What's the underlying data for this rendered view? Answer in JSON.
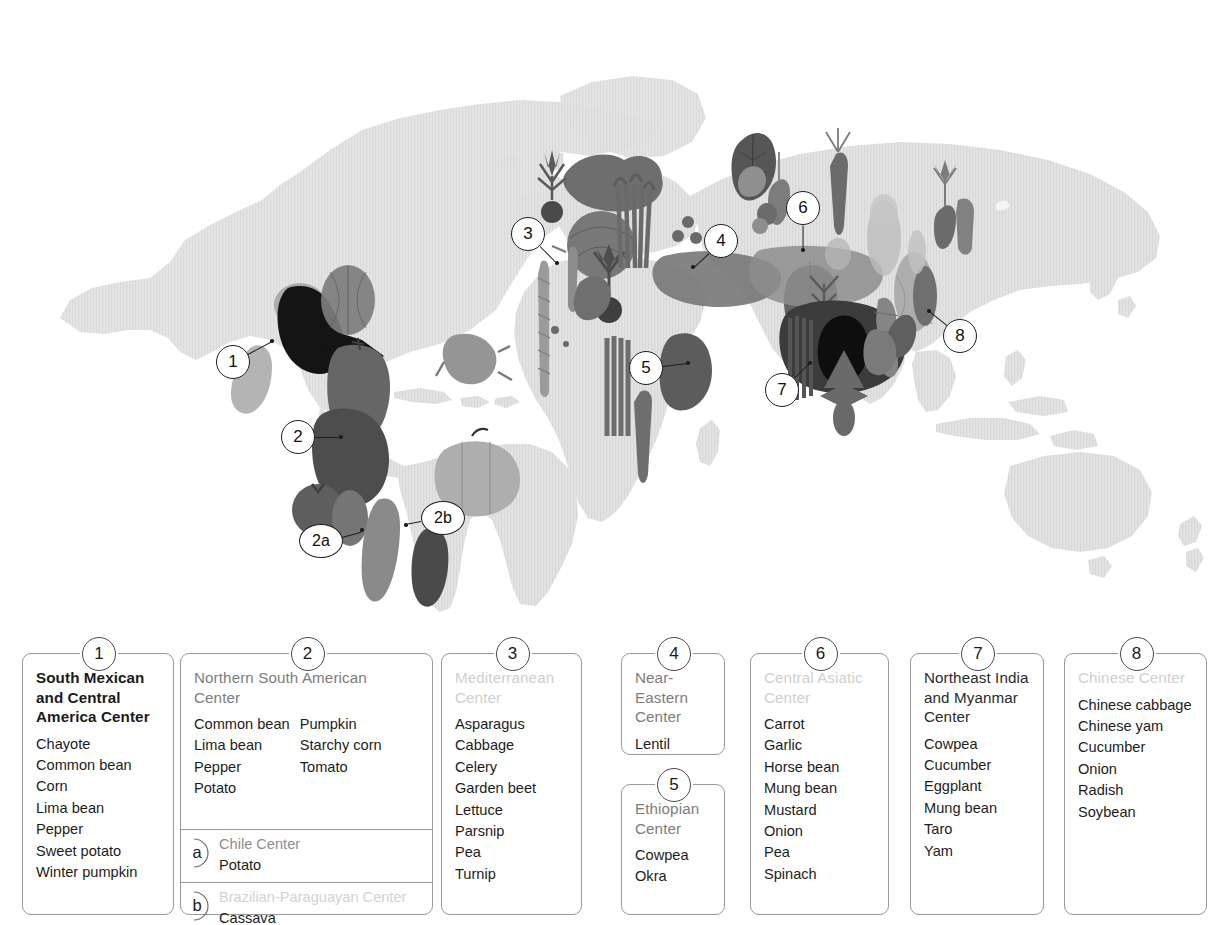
{
  "map": {
    "title": "Centers of Origin of Cultivated Vegetables",
    "landmass_color": "#e2e2e2",
    "ocean_color": "#ffffff",
    "markers": [
      {
        "id": "1",
        "label": "1",
        "x": 233,
        "y": 362,
        "tip_x": 272,
        "tip_y": 341
      },
      {
        "id": "2",
        "label": "2",
        "x": 298,
        "y": 437,
        "tip_x": 341,
        "tip_y": 437
      },
      {
        "id": "2a",
        "label": "2a",
        "x": 321,
        "y": 541,
        "tip_x": 362,
        "tip_y": 530
      },
      {
        "id": "2b",
        "label": "2b",
        "x": 443,
        "y": 518,
        "tip_x": 406,
        "tip_y": 525
      },
      {
        "id": "3",
        "label": "3",
        "x": 528,
        "y": 234,
        "tip_x": 557,
        "tip_y": 263
      },
      {
        "id": "4",
        "label": "4",
        "x": 721,
        "y": 241,
        "tip_x": 693,
        "tip_y": 267
      },
      {
        "id": "5",
        "label": "5",
        "x": 646,
        "y": 368,
        "tip_x": 688,
        "tip_y": 363
      },
      {
        "id": "6",
        "label": "6",
        "x": 803,
        "y": 208,
        "tip_x": 803,
        "tip_y": 250
      },
      {
        "id": "7",
        "label": "7",
        "x": 782,
        "y": 390,
        "tip_x": 810,
        "tip_y": 363
      },
      {
        "id": "8",
        "label": "8",
        "x": 960,
        "y": 336,
        "tip_x": 929,
        "tip_y": 311
      }
    ],
    "vegetable_icons": [
      "chayote",
      "squash",
      "maize",
      "pepper",
      "bean-pod",
      "tomato",
      "potato",
      "cassava",
      "lettuce",
      "cabbage",
      "asparagus",
      "beet",
      "parsnip",
      "celery",
      "turnip",
      "carrot",
      "okra",
      "cowpea",
      "garlic",
      "onion",
      "spinach",
      "radish",
      "cucumber",
      "eggplant",
      "chinese-cabbage",
      "yam",
      "soybean",
      "taro",
      "mung-bean",
      "horse-bean"
    ]
  },
  "legend": {
    "panels": [
      {
        "number": "1",
        "title": "South Mexican\nand Central\nAmerica Center",
        "title_style": "bold",
        "columns": [
          [
            "Chayote",
            "Common bean",
            "Corn",
            "Lima bean",
            "Pepper",
            "Sweet potato",
            "Winter pumpkin"
          ]
        ]
      },
      {
        "number": "2",
        "title": "Northern South American\nCenter",
        "title_style": "mid",
        "columns": [
          [
            "Common bean",
            "Lima bean",
            "Pepper",
            "Potato"
          ],
          [
            "Pumpkin",
            "Starchy corn",
            "Tomato"
          ]
        ],
        "subpanels": [
          {
            "letter": "a",
            "title": "Chile Center",
            "title_style": "mid",
            "items": [
              "Potato"
            ]
          },
          {
            "letter": "b",
            "title": "Brazilian-Paraguayan Center",
            "title_style": "pale",
            "items": [
              "Cassava"
            ]
          }
        ]
      },
      {
        "number": "3",
        "title": "Mediterranean\nCenter",
        "title_style": "pale",
        "columns": [
          [
            "Asparagus",
            "Cabbage",
            "Celery",
            "Garden beet",
            "Lettuce",
            "Parsnip",
            "Pea",
            "Turnip"
          ]
        ]
      },
      {
        "number": "4",
        "title": "Near-Eastern\nCenter",
        "title_style": "mid",
        "columns": [
          [
            "Lentil"
          ]
        ]
      },
      {
        "number": "5",
        "title": "Ethiopian\nCenter",
        "title_style": "mid",
        "columns": [
          [
            "Cowpea",
            "Okra"
          ]
        ]
      },
      {
        "number": "6",
        "title": "Central Asiatic\nCenter",
        "title_style": "pale",
        "columns": [
          [
            "Carrot",
            "Garlic",
            "Horse bean",
            "Mung bean",
            "Mustard",
            "Onion",
            "Pea",
            "Spinach"
          ]
        ]
      },
      {
        "number": "7",
        "title": "Northeast India\nand Myanmar\nCenter",
        "title_style": "dark",
        "columns": [
          [
            "Cowpea",
            "Cucumber",
            "Eggplant",
            "Mung bean",
            "Taro",
            "Yam"
          ]
        ]
      },
      {
        "number": "8",
        "title": "Chinese Center",
        "title_style": "pale",
        "columns": [
          [
            "Chinese cabbage",
            "Chinese yam",
            "Cucumber",
            "Onion",
            "Radish",
            "Soybean"
          ]
        ]
      }
    ]
  }
}
